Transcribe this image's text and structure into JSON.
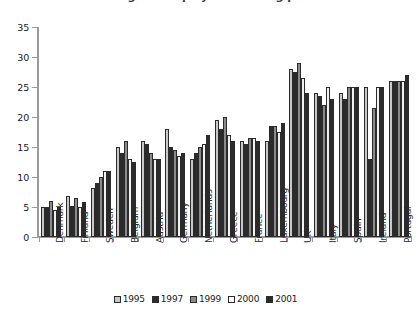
{
  "title": {
    "text": "Percentage of employees working part-time",
    "cropped": true
  },
  "chart_data": {
    "type": "bar",
    "title": "Percentage of employees working part-time",
    "xlabel": "",
    "ylabel": "",
    "ylim": [
      0,
      35
    ],
    "ytick_step": 5,
    "yticks": [
      "0",
      "5",
      "10",
      "15",
      "20",
      "25",
      "30",
      "35"
    ],
    "grid": false,
    "legend_position": "bottom-center",
    "categories": [
      "Denmark",
      "Finland",
      "Sweden",
      "Belgium",
      "Austria",
      "Germany",
      "Netherlands",
      "Greece",
      "France",
      "Luxembourg",
      "UK",
      "Italy",
      "Spain",
      "Ireland",
      "Portugal"
    ],
    "series": [
      {
        "name": "1995",
        "color": "#c8c8c8",
        "values": [
          5.0,
          6.8,
          8.2,
          15.0,
          16.0,
          18.0,
          13.0,
          19.5,
          16.0,
          16.0,
          28.0,
          24.0,
          24.0,
          25.0,
          26.0
        ]
      },
      {
        "name": "1997",
        "color": "#2b2b2b",
        "values": [
          5.0,
          5.2,
          9.0,
          14.0,
          15.5,
          15.0,
          14.0,
          18.0,
          15.5,
          18.5,
          27.5,
          23.5,
          23.0,
          13.0,
          26.0
        ]
      },
      {
        "name": "1999",
        "color": "#8a8a8a",
        "values": [
          6.0,
          6.5,
          10.0,
          16.0,
          14.0,
          14.5,
          15.0,
          20.0,
          16.5,
          18.5,
          29.0,
          22.0,
          25.0,
          21.5,
          26.0
        ]
      },
      {
        "name": "2000",
        "color": "#f2f2f2",
        "values": [
          4.5,
          5.0,
          11.0,
          13.0,
          13.0,
          13.5,
          15.5,
          17.0,
          16.5,
          17.5,
          26.5,
          25.0,
          25.0,
          25.0,
          26.0
        ]
      },
      {
        "name": "2001",
        "color": "#2b2b2b",
        "values": [
          5.0,
          5.8,
          11.0,
          12.5,
          13.0,
          14.0,
          17.0,
          16.0,
          16.0,
          19.0,
          24.0,
          23.0,
          25.0,
          25.0,
          27.0
        ]
      }
    ]
  },
  "legend": {
    "items": [
      {
        "label": "1995",
        "color": "#c8c8c8"
      },
      {
        "label": "1997",
        "color": "#2b2b2b"
      },
      {
        "label": "1999",
        "color": "#8a8a8a"
      },
      {
        "label": "2000",
        "color": "#ffffff"
      },
      {
        "label": "2001",
        "color": "#2b2b2b"
      }
    ]
  }
}
